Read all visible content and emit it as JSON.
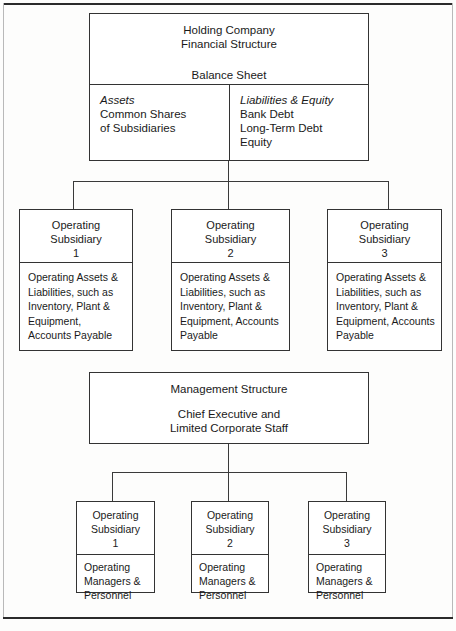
{
  "diagram": {
    "holding": {
      "title_line1": "Holding Company",
      "title_line2": "Financial Structure",
      "balance_sheet_label": "Balance Sheet",
      "assets": {
        "heading": "Assets",
        "lines": [
          "Common Shares",
          "of Subsidiaries"
        ]
      },
      "liabilities": {
        "heading": "Liabilities & Equity",
        "lines": [
          "Bank Debt",
          "Long-Term Debt",
          "Equity"
        ]
      }
    },
    "financial_subsidiaries": [
      {
        "head_line1": "Operating",
        "head_line2": "Subsidiary",
        "number": "1",
        "body": "Operating Assets & Liabilities, such as Inventory, Plant & Equipment, Accounts Payable"
      },
      {
        "head_line1": "Operating",
        "head_line2": "Subsidiary",
        "number": "2",
        "body": "Operating Assets & Liabilities, such as Inventory, Plant & Equipment, Accounts Payable"
      },
      {
        "head_line1": "Operating",
        "head_line2": "Subsidiary",
        "number": "3",
        "body": "Operating Assets & Liabilities, such as Inventory, Plant & Equipment, Accounts Payable"
      }
    ],
    "management": {
      "title": "Management Structure",
      "sub_line1": "Chief Executive and",
      "sub_line2": "Limited Corporate Staff"
    },
    "management_subsidiaries": [
      {
        "head_line1": "Operating",
        "head_line2": "Subsidiary",
        "number": "1",
        "body": "Operating Managers & Personnel"
      },
      {
        "head_line1": "Operating",
        "head_line2": "Subsidiary",
        "number": "2",
        "body": "Operating Managers & Personnel"
      },
      {
        "head_line1": "Operating",
        "head_line2": "Subsidiary",
        "number": "3",
        "body": "Operating Managers & Personnel"
      }
    ]
  },
  "colors": {
    "line": "#333333",
    "rule": "#2b2b2b",
    "text": "#1a1a1a",
    "page": "#fdfdfc"
  }
}
